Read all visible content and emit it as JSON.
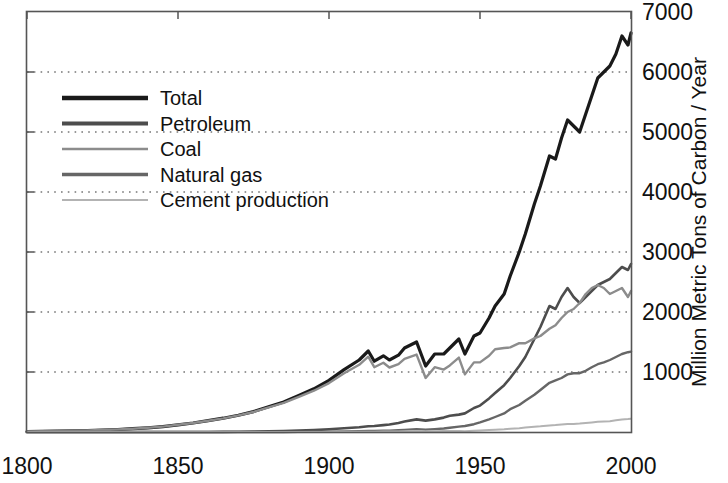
{
  "chart_data": {
    "type": "line",
    "title": "",
    "xlabel": "",
    "ylabel": "Million Metric Tons of Carbon / Year",
    "xlim": [
      1800,
      2000
    ],
    "ylim": [
      0,
      7000
    ],
    "xticks": [
      "1800",
      "1850",
      "1900",
      "1950",
      "2000"
    ],
    "xtick_values": [
      1800,
      1850,
      1900,
      1950,
      2000
    ],
    "yticks": [
      "1000",
      "2000",
      "3000",
      "4000",
      "5000",
      "6000",
      "7000"
    ],
    "ytick_values": [
      1000,
      2000,
      3000,
      4000,
      5000,
      6000,
      7000
    ],
    "grid": "horizontal-dotted",
    "legend_position": "upper-left",
    "x": [
      1800,
      1805,
      1810,
      1815,
      1820,
      1825,
      1830,
      1835,
      1840,
      1845,
      1850,
      1855,
      1860,
      1865,
      1870,
      1875,
      1880,
      1885,
      1890,
      1895,
      1900,
      1905,
      1910,
      1913,
      1915,
      1918,
      1920,
      1923,
      1925,
      1929,
      1932,
      1935,
      1938,
      1940,
      1943,
      1945,
      1948,
      1950,
      1953,
      1955,
      1958,
      1960,
      1963,
      1965,
      1968,
      1970,
      1973,
      1975,
      1977,
      1979,
      1981,
      1983,
      1985,
      1987,
      1989,
      1991,
      1993,
      1995,
      1997,
      1999,
      2000
    ],
    "series": [
      {
        "name": "Total",
        "color": "#1a1a1a",
        "width": 3.2,
        "values": [
          8,
          12,
          16,
          20,
          25,
          33,
          42,
          55,
          70,
          90,
          120,
          150,
          190,
          230,
          280,
          340,
          420,
          500,
          610,
          720,
          860,
          1040,
          1200,
          1350,
          1180,
          1270,
          1200,
          1280,
          1400,
          1500,
          1100,
          1300,
          1300,
          1400,
          1550,
          1300,
          1600,
          1650,
          1900,
          2100,
          2300,
          2600,
          3000,
          3300,
          3800,
          4100,
          4600,
          4550,
          4900,
          5200,
          5100,
          5000,
          5300,
          5600,
          5900,
          6000,
          6100,
          6300,
          6600,
          6450,
          6650
        ]
      },
      {
        "name": "Petroleum",
        "color": "#4d4d4d",
        "width": 2.6,
        "values": [
          0,
          0,
          0,
          0,
          0,
          0,
          0,
          0,
          0,
          0,
          0,
          0,
          1,
          2,
          4,
          7,
          11,
          16,
          24,
          32,
          45,
          62,
          80,
          95,
          100,
          115,
          125,
          150,
          175,
          210,
          190,
          210,
          240,
          270,
          290,
          310,
          400,
          440,
          560,
          650,
          780,
          900,
          1100,
          1250,
          1550,
          1750,
          2100,
          2050,
          2250,
          2400,
          2250,
          2150,
          2250,
          2350,
          2450,
          2500,
          2550,
          2650,
          2750,
          2700,
          2800
        ]
      },
      {
        "name": "Coal",
        "color": "#8c8c8c",
        "width": 2.4,
        "values": [
          8,
          12,
          16,
          20,
          25,
          33,
          42,
          55,
          70,
          90,
          120,
          150,
          188,
          228,
          276,
          333,
          409,
          484,
          586,
          688,
          815,
          978,
          1120,
          1255,
          1080,
          1155,
          1075,
          1130,
          1220,
          1290,
          900,
          1080,
          1040,
          1110,
          1240,
          960,
          1160,
          1160,
          1270,
          1380,
          1400,
          1410,
          1480,
          1480,
          1560,
          1600,
          1720,
          1780,
          1900,
          2000,
          2050,
          2150,
          2300,
          2400,
          2450,
          2400,
          2300,
          2350,
          2400,
          2250,
          2350
        ]
      },
      {
        "name": "Natural gas",
        "color": "#666666",
        "width": 2.4,
        "values": [
          0,
          0,
          0,
          0,
          0,
          0,
          0,
          0,
          0,
          0,
          0,
          0,
          0,
          0,
          0,
          0,
          0,
          1,
          2,
          4,
          6,
          9,
          13,
          16,
          17,
          20,
          23,
          30,
          36,
          48,
          40,
          48,
          58,
          70,
          90,
          100,
          130,
          160,
          210,
          250,
          310,
          380,
          450,
          520,
          620,
          700,
          820,
          860,
          900,
          960,
          980,
          980,
          1020,
          1080,
          1130,
          1160,
          1200,
          1250,
          1300,
          1330,
          1340
        ]
      },
      {
        "name": "Cement production",
        "color": "#b3b3b3",
        "width": 2.0,
        "values": [
          0,
          0,
          0,
          0,
          0,
          0,
          0,
          0,
          0,
          0,
          0,
          0,
          0,
          0,
          0,
          0,
          0,
          0,
          0,
          1,
          2,
          3,
          5,
          6,
          6,
          7,
          8,
          10,
          12,
          15,
          10,
          12,
          16,
          18,
          17,
          14,
          22,
          26,
          33,
          38,
          46,
          54,
          64,
          73,
          88,
          95,
          110,
          115,
          125,
          135,
          135,
          140,
          150,
          160,
          170,
          175,
          180,
          195,
          210,
          215,
          220
        ]
      }
    ],
    "legend": [
      {
        "label": "Total",
        "color": "#1a1a1a",
        "width": 4.5
      },
      {
        "label": "Petroleum",
        "color": "#4d4d4d",
        "width": 3.8
      },
      {
        "label": "Coal",
        "color": "#8c8c8c",
        "width": 2.6
      },
      {
        "label": "Natural gas",
        "color": "#666666",
        "width": 3.4
      },
      {
        "label": "Cement production",
        "color": "#b3b3b3",
        "width": 2.0
      }
    ]
  }
}
